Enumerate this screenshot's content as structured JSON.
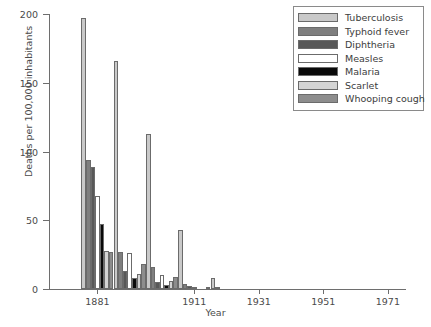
{
  "chart_data": {
    "type": "bar",
    "title": "",
    "xlabel": "Year",
    "ylabel": "Deaths per 100,000 inhabitants",
    "ylim": [
      0,
      200
    ],
    "yticks": [
      0,
      50,
      100,
      150,
      200
    ],
    "xticks": [
      1881,
      1911,
      1931,
      1951,
      1971
    ],
    "xlim": [
      1866,
      1976
    ],
    "grid": false,
    "legend_position": "top-right",
    "categories": [
      1881,
      1891,
      1901,
      1911,
      1921,
      1931,
      1941,
      1951,
      1961,
      1971
    ],
    "series": [
      {
        "name": "Tuberculosis",
        "color": "#c9c9c9",
        "values": [
          197,
          166,
          113,
          43,
          8,
          0,
          0,
          0,
          0,
          0
        ]
      },
      {
        "name": "Typhoid fever",
        "color": "#7f7f7f",
        "values": [
          94,
          27,
          16,
          4,
          1,
          0,
          0,
          0,
          0,
          0
        ]
      },
      {
        "name": "Diphtheria",
        "color": "#585858",
        "values": [
          89,
          13,
          5,
          2,
          0,
          0,
          0,
          0,
          0,
          0
        ]
      },
      {
        "name": "Measles",
        "color": "#ffffff",
        "values": [
          68,
          26,
          10,
          1,
          0,
          0,
          0,
          0,
          0,
          0
        ]
      },
      {
        "name": "Malaria",
        "color": "#0a0a0a",
        "values": [
          47,
          8,
          3,
          0,
          0,
          0,
          0,
          0,
          0,
          0
        ]
      },
      {
        "name": "Scarlet",
        "color": "#d4d4d4",
        "values": [
          28,
          11,
          6,
          0,
          0,
          0,
          0,
          0,
          0,
          0
        ]
      },
      {
        "name": "Whooping cough",
        "color": "#8d8d8d",
        "values": [
          27,
          18,
          9,
          1,
          0,
          0,
          0,
          0,
          0,
          0
        ]
      }
    ]
  },
  "legend": {
    "items": [
      {
        "label": "Tuberculosis",
        "color": "#c9c9c9"
      },
      {
        "label": "Typhoid fever",
        "color": "#7f7f7f"
      },
      {
        "label": "Diphtheria",
        "color": "#585858"
      },
      {
        "label": "Measles",
        "color": "#ffffff"
      },
      {
        "label": "Malaria",
        "color": "#0a0a0a"
      },
      {
        "label": "Scarlet",
        "color": "#d4d4d4"
      },
      {
        "label": "Whooping cough",
        "color": "#8d8d8d"
      }
    ]
  }
}
